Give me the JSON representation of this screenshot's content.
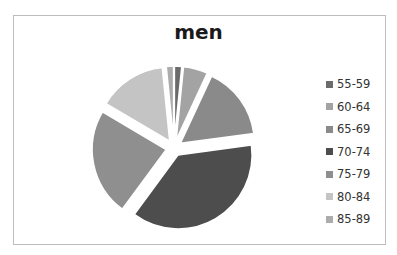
{
  "chart_data": {
    "type": "pie",
    "title": "men",
    "exploded": true,
    "legend_position": "right",
    "categories": [
      "55-59",
      "60-64",
      "65-69",
      "70-74",
      "75-79",
      "80-84",
      "85-89"
    ],
    "values": [
      1.5,
      5,
      15,
      35,
      22,
      14,
      1.5
    ],
    "colors": [
      "#6b6b6b",
      "#a3a3a3",
      "#8a8a8a",
      "#4d4d4d",
      "#8f8f8f",
      "#c4c4c4",
      "#acacac"
    ]
  },
  "legend": {
    "items": [
      {
        "label": "55-59",
        "color": "#6b6b6b"
      },
      {
        "label": "60-64",
        "color": "#a3a3a3"
      },
      {
        "label": "65-69",
        "color": "#8a8a8a"
      },
      {
        "label": "70-74",
        "color": "#4d4d4d"
      },
      {
        "label": "75-79",
        "color": "#8f8f8f"
      },
      {
        "label": "80-84",
        "color": "#c4c4c4"
      },
      {
        "label": "85-89",
        "color": "#acacac"
      }
    ]
  }
}
